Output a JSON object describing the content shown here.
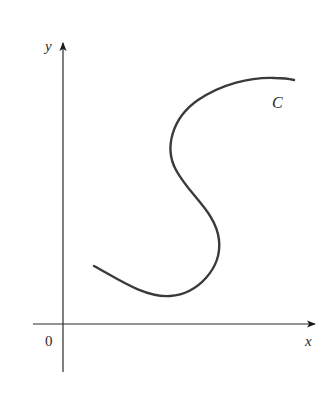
{
  "diagram": {
    "type": "curve-on-axes",
    "axes": {
      "x_label": "x",
      "y_label": "y",
      "origin_label": "0",
      "color": "#2a2a2a"
    },
    "curve": {
      "label": "C",
      "color": "#3a3a3a",
      "description": "Smooth S-shaped curve in the first quadrant: starts low-left, dips to a minimum, bulges right, curls back left, then rises and flattens toward the upper right"
    }
  }
}
